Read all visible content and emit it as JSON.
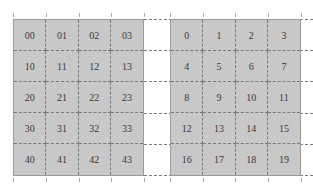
{
  "figure": {
    "left_grid": {
      "rows": [
        [
          "00",
          "01",
          "02",
          "03"
        ],
        [
          "10",
          "11",
          "12",
          "13"
        ],
        [
          "20",
          "21",
          "22",
          "23"
        ],
        [
          "30",
          "31",
          "32",
          "33"
        ],
        [
          "40",
          "41",
          "42",
          "43"
        ]
      ]
    },
    "right_grid": {
      "rows": [
        [
          "0",
          "1",
          "2",
          "3"
        ],
        [
          "4",
          "5",
          "6",
          "7"
        ],
        [
          "8",
          "9",
          "10",
          "11"
        ],
        [
          "12",
          "13",
          "14",
          "15"
        ],
        [
          "16",
          "17",
          "18",
          "19"
        ]
      ]
    },
    "colors": {
      "cell_fill": "#c8c8c8",
      "grid_line": "#7a7a7a",
      "text": "#3a3a3a"
    }
  }
}
